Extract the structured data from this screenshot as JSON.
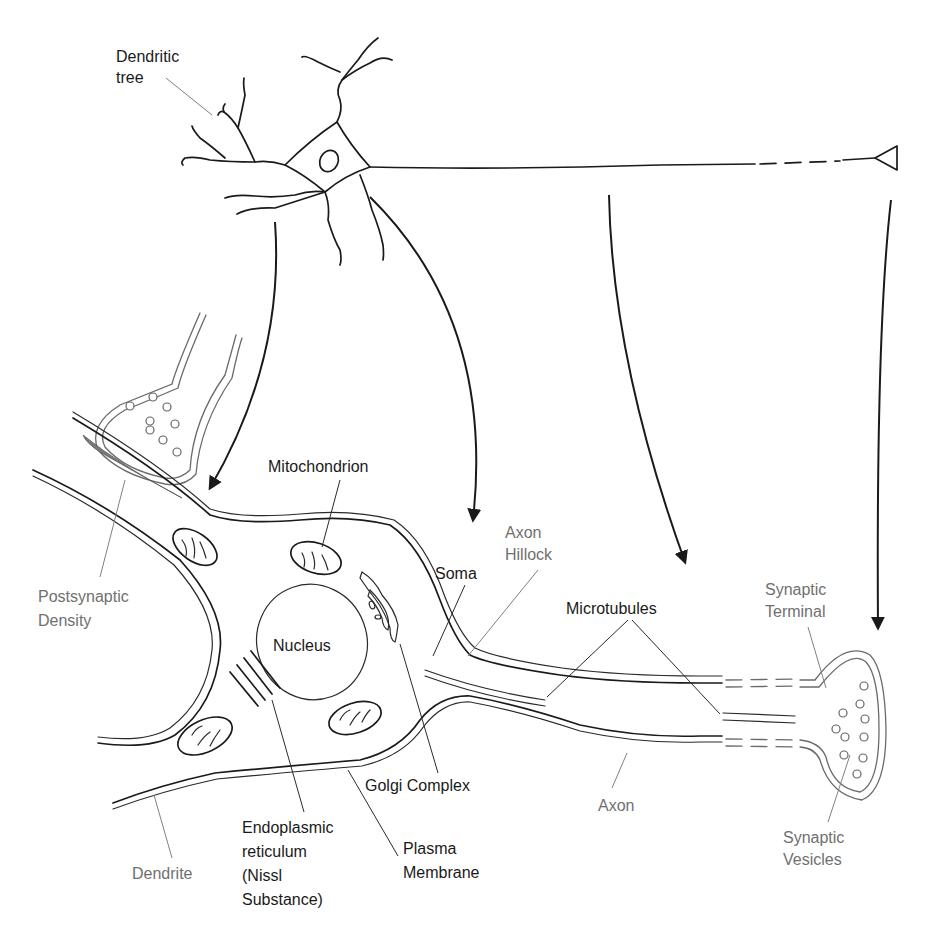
{
  "labels": {
    "dendritic_tree": [
      "Dendritic",
      "tree"
    ],
    "mitochondrion": "Mitochondrion",
    "postsynaptic_density": [
      "Postsynaptic",
      "Density"
    ],
    "nucleus": "Nucleus",
    "soma": "Soma",
    "axon_hillock": [
      "Axon",
      "Hillock"
    ],
    "microtubules": "Microtubules",
    "synaptic_terminal": [
      "Synaptic",
      "Terminal"
    ],
    "golgi_complex": "Golgi Complex",
    "endoplasmic_reticulum": [
      "Endoplasmic",
      "reticulum",
      "(Nissl",
      "Substance)"
    ],
    "plasma_membrane": [
      "Plasma",
      "Membrane"
    ],
    "dendrite": "Dendrite",
    "axon": "Axon",
    "synaptic_vesicles": [
      "Synaptic",
      "Vesicles"
    ]
  },
  "colors": {
    "ink": "#1a1a1a",
    "gray_label": "#707070",
    "postsynaptic_density_fill": "#7a7a7a",
    "background": "#ffffff"
  }
}
